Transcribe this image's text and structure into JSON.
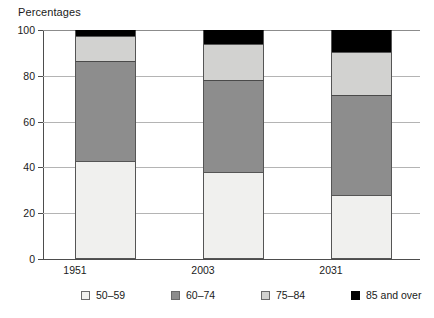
{
  "chart_data": {
    "type": "bar",
    "subtype": "stacked-bar-100-percent",
    "title": "Percentages",
    "xlabel": "",
    "ylabel": "",
    "ylim": [
      0,
      100
    ],
    "yticks": [
      0,
      20,
      40,
      60,
      80,
      100
    ],
    "ytick_labels": [
      "0",
      "20",
      "40",
      "60",
      "80",
      "100"
    ],
    "grid": "horizontal",
    "legend_position": "bottom",
    "categories": [
      "1951",
      "2003",
      "2031"
    ],
    "series": [
      {
        "name": "50–59",
        "color": "#f0f0ee",
        "values": [
          43.0,
          38.0,
          28.0
        ]
      },
      {
        "name": "60–74",
        "color": "#8d8d8d",
        "values": [
          43.5,
          40.0,
          43.5
        ]
      },
      {
        "name": "75–84",
        "color": "#d2d2d0",
        "values": [
          11.0,
          16.0,
          19.0
        ]
      },
      {
        "name": "85 and over",
        "color": "#000000",
        "values": [
          2.5,
          6.0,
          9.5
        ]
      }
    ],
    "cumulative_tops": {
      "1951": [
        43.0,
        86.5,
        97.5,
        100.0
      ],
      "2003": [
        38.0,
        78.0,
        94.0,
        100.0
      ],
      "2031": [
        28.0,
        71.5,
        90.5,
        100.0
      ]
    }
  },
  "legend": {
    "items": [
      {
        "label": "50–59",
        "swatch": "#f0f0ee"
      },
      {
        "label": "60–74",
        "swatch": "#8d8d8d"
      },
      {
        "label": "75–84",
        "swatch": "#d2d2d0"
      },
      {
        "label": "85 and over",
        "swatch": "#000000"
      }
    ]
  },
  "axis": {
    "y_labels": [
      "100",
      "80",
      "60",
      "40",
      "20",
      "0"
    ],
    "x_labels": [
      "1951",
      "2003",
      "2031"
    ]
  }
}
